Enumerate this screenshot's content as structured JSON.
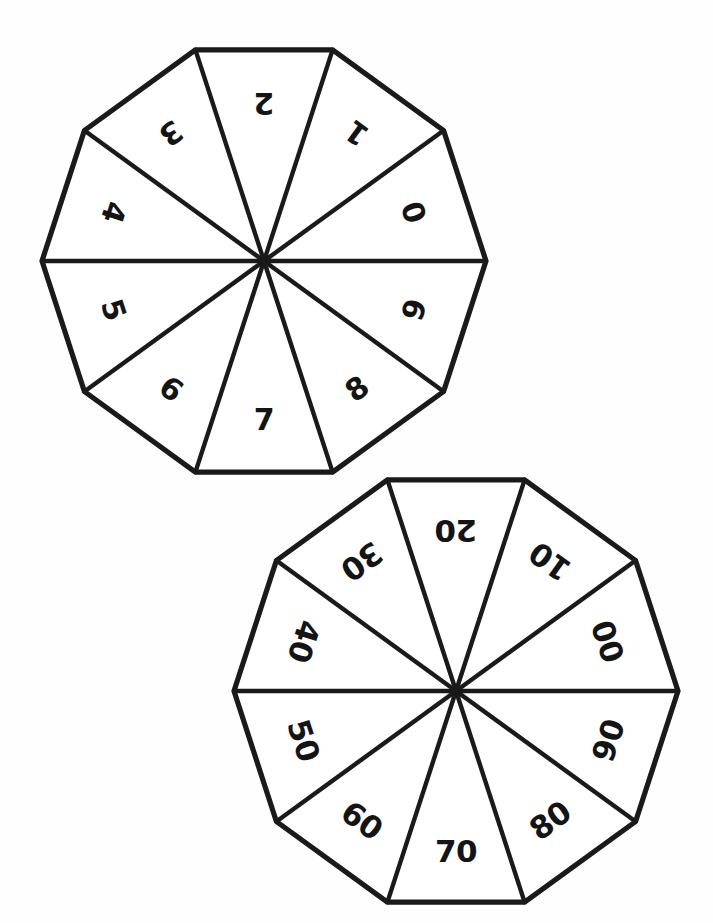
{
  "page": {
    "background_color": "#fefefe",
    "ink_color": "#1a1a1a",
    "width": 713,
    "height": 923
  },
  "spinners": [
    {
      "name": "units-spinner",
      "sides": 10,
      "center_x": 264,
      "center_y": 261,
      "radius": 222,
      "rotation_deg": 18,
      "label_radius": 158,
      "label_class": "label-s1",
      "labels": [
        "0",
        "1",
        "2",
        "3",
        "4",
        "5",
        "6",
        "7",
        "8",
        "9"
      ]
    },
    {
      "name": "tens-spinner",
      "sides": 10,
      "center_x": 456,
      "center_y": 691,
      "radius": 222,
      "rotation_deg": 18,
      "label_radius": 160,
      "label_class": "label-s2",
      "labels": [
        "00",
        "10",
        "20",
        "30",
        "40",
        "50",
        "60",
        "70",
        "80",
        "90"
      ]
    }
  ],
  "chart_data": {
    "type": "pie",
    "title": "",
    "xlabel": "",
    "ylabel": "",
    "legend": "none",
    "grid": false,
    "charts": [
      {
        "name": "units-spinner",
        "categories": [
          "0",
          "1",
          "2",
          "3",
          "4",
          "5",
          "6",
          "7",
          "8",
          "9"
        ],
        "values": [
          10,
          10,
          10,
          10,
          10,
          10,
          10,
          10,
          10,
          10
        ]
      },
      {
        "name": "tens-spinner",
        "categories": [
          "00",
          "10",
          "20",
          "30",
          "40",
          "50",
          "60",
          "70",
          "80",
          "90"
        ],
        "values": [
          10,
          10,
          10,
          10,
          10,
          10,
          10,
          10,
          10,
          10
        ]
      }
    ]
  }
}
